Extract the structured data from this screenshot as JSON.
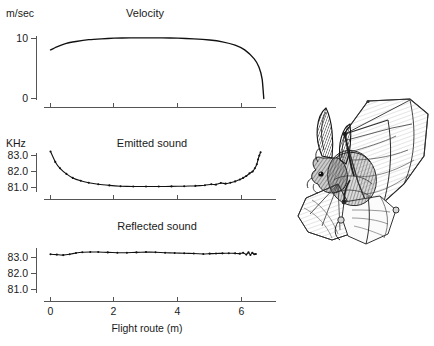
{
  "figure": {
    "caption_present": false,
    "illustration": {
      "name": "bat-in-flight-drawing",
      "alt": "Pen-and-ink drawing of a bat in flight with wings spread"
    }
  },
  "chart_data": [
    {
      "type": "line",
      "title": "Velocity",
      "ylabel": "m/sec",
      "xlabel": "",
      "ylim": [
        0,
        11.5
      ],
      "yticks": [
        0,
        10
      ],
      "ytick_labels": [
        "0",
        "10"
      ],
      "xlim": [
        -0.3,
        7.0
      ],
      "xticks": [
        0,
        2,
        4,
        6
      ],
      "xtick_labels": [
        "",
        "",
        "",
        ""
      ],
      "grid": false,
      "legend": null,
      "markers": false,
      "x": [
        0.0,
        0.2,
        0.5,
        0.8,
        1.2,
        1.6,
        2.0,
        2.5,
        3.0,
        3.5,
        4.0,
        4.5,
        5.0,
        5.4,
        5.8,
        6.1,
        6.4,
        6.55,
        6.65,
        6.7
      ],
      "values": [
        8.1,
        8.6,
        9.2,
        9.5,
        9.8,
        9.95,
        10.05,
        10.1,
        10.1,
        10.1,
        10.05,
        9.95,
        9.75,
        9.45,
        8.9,
        8.1,
        6.6,
        5.2,
        3.2,
        0.0
      ]
    },
    {
      "type": "line",
      "title": "Emitted sound",
      "ylabel": "KHz",
      "xlabel": "",
      "ylim": [
        80.75,
        83.45
      ],
      "yticks": [
        81.0,
        82.0,
        83.0
      ],
      "ytick_labels": [
        "81.0",
        "82.0",
        "83.0"
      ],
      "xlim": [
        -0.3,
        7.0
      ],
      "xticks": [
        0,
        2,
        4,
        6
      ],
      "xtick_labels": [
        "",
        "",
        "",
        ""
      ],
      "grid": false,
      "legend": null,
      "markers": true,
      "x": [
        0.0,
        0.15,
        0.3,
        0.5,
        0.7,
        0.95,
        1.2,
        1.5,
        1.85,
        2.2,
        2.6,
        3.0,
        3.4,
        3.8,
        4.2,
        4.55,
        4.85,
        5.05,
        5.2,
        5.35,
        5.5,
        5.65,
        5.8,
        5.95,
        6.05,
        6.15,
        6.25,
        6.35,
        6.42,
        6.48,
        6.52,
        6.56,
        6.6
      ],
      "values": [
        83.25,
        82.6,
        82.2,
        81.85,
        81.6,
        81.42,
        81.3,
        81.2,
        81.13,
        81.08,
        81.06,
        81.06,
        81.06,
        81.07,
        81.08,
        81.1,
        81.14,
        81.2,
        81.18,
        81.28,
        81.24,
        81.3,
        81.38,
        81.5,
        81.6,
        81.72,
        81.88,
        82.0,
        82.2,
        82.45,
        82.75,
        83.0,
        83.2
      ]
    },
    {
      "type": "line",
      "title": "Reflected sound",
      "ylabel": "",
      "xlabel": "Flight route (m)",
      "ylim": [
        80.75,
        83.65
      ],
      "yticks": [
        81.0,
        82.0,
        83.0
      ],
      "ytick_labels": [
        "81.0",
        "82.0",
        "83.0"
      ],
      "xlim": [
        -0.3,
        7.0
      ],
      "xticks": [
        0,
        2,
        4,
        6
      ],
      "xtick_labels": [
        "0",
        "2",
        "4",
        "6"
      ],
      "grid": false,
      "legend": null,
      "markers": true,
      "x": [
        0.0,
        0.2,
        0.4,
        0.6,
        0.8,
        1.0,
        1.25,
        1.5,
        1.8,
        2.1,
        2.4,
        2.7,
        3.0,
        3.3,
        3.6,
        3.9,
        4.2,
        4.5,
        4.8,
        5.0,
        5.2,
        5.4,
        5.6,
        5.8,
        5.95,
        6.05,
        6.15,
        6.22,
        6.28,
        6.34,
        6.4,
        6.45
      ],
      "values": [
        83.2,
        83.18,
        83.15,
        83.2,
        83.28,
        83.33,
        83.34,
        83.34,
        83.32,
        83.3,
        83.3,
        83.32,
        83.34,
        83.33,
        83.3,
        83.28,
        83.27,
        83.25,
        83.22,
        83.24,
        83.25,
        83.26,
        83.27,
        83.26,
        83.24,
        83.3,
        83.18,
        83.32,
        83.16,
        83.3,
        83.2,
        83.22
      ]
    }
  ],
  "labels": {
    "velocity_unit": "m/sec",
    "velocity_title": "Velocity",
    "velocity_y_10": "10",
    "velocity_y_0": "0",
    "emitted_unit": "KHz",
    "emitted_title": "Emitted sound",
    "emitted_y_830": "83.0",
    "emitted_y_820": "82.0",
    "emitted_y_810": "81.0",
    "reflected_title": "Reflected sound",
    "reflected_y_830": "83.0",
    "reflected_y_820": "82.0",
    "reflected_y_810": "81.0",
    "x_0": "0",
    "x_2": "2",
    "x_4": "4",
    "x_6": "6",
    "x_axis_title": "Flight route (m)"
  }
}
